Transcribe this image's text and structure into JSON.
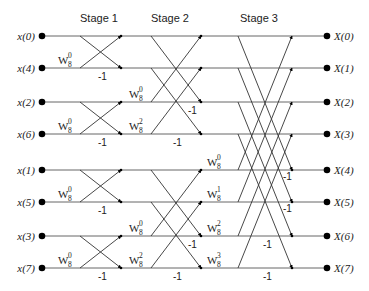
{
  "stages": [
    {
      "label": "Stage 1",
      "x": 80,
      "y": 22
    },
    {
      "label": "Stage 2",
      "x": 151,
      "y": 22
    },
    {
      "label": "Stage 3",
      "x": 240,
      "y": 22
    }
  ],
  "rows_y": [
    36,
    68,
    102,
    134,
    170,
    202,
    236,
    268
  ],
  "inputs": [
    {
      "label": "x(0)",
      "row": 0
    },
    {
      "label": "x(4)",
      "row": 1
    },
    {
      "label": "x(2)",
      "row": 2
    },
    {
      "label": "x(6)",
      "row": 3
    },
    {
      "label": "x(1)",
      "row": 4
    },
    {
      "label": "x(5)",
      "row": 5
    },
    {
      "label": "x(3)",
      "row": 6
    },
    {
      "label": "x(7)",
      "row": 7
    }
  ],
  "outputs": [
    {
      "label": "X(0)",
      "row": 0
    },
    {
      "label": "X(1)",
      "row": 1
    },
    {
      "label": "X(2)",
      "row": 2
    },
    {
      "label": "X(3)",
      "row": 3
    },
    {
      "label": "X(4)",
      "row": 4
    },
    {
      "label": "X(5)",
      "row": 5
    },
    {
      "label": "X(6)",
      "row": 6
    },
    {
      "label": "X(7)",
      "row": 7
    }
  ],
  "twiddles": [
    {
      "base": "W",
      "sub": "8",
      "sup": "0",
      "row": 1,
      "x": 58
    },
    {
      "base": "W",
      "sub": "8",
      "sup": "0",
      "row": 3,
      "x": 58
    },
    {
      "base": "W",
      "sub": "8",
      "sup": "0",
      "row": 5,
      "x": 58
    },
    {
      "base": "W",
      "sub": "8",
      "sup": "0",
      "row": 7,
      "x": 58
    },
    {
      "base": "W",
      "sub": "8",
      "sup": "0",
      "row": 2,
      "x": 129
    },
    {
      "base": "W",
      "sub": "8",
      "sup": "2",
      "row": 3,
      "x": 129
    },
    {
      "base": "W",
      "sub": "8",
      "sup": "0",
      "row": 6,
      "x": 129
    },
    {
      "base": "W",
      "sub": "8",
      "sup": "2",
      "row": 7,
      "x": 129
    },
    {
      "base": "W",
      "sub": "8",
      "sup": "0",
      "row": 4,
      "x": 207
    },
    {
      "base": "W",
      "sub": "8",
      "sup": "1",
      "row": 5,
      "x": 207
    },
    {
      "base": "W",
      "sub": "8",
      "sup": "2",
      "row": 6,
      "x": 207
    },
    {
      "base": "W",
      "sub": "8",
      "sup": "3",
      "row": 7,
      "x": 207
    }
  ],
  "neg_labels": [
    {
      "text": "-1",
      "x": 98,
      "row": 1,
      "dy": 12
    },
    {
      "text": "-1",
      "x": 98,
      "row": 3,
      "dy": 12
    },
    {
      "text": "-1",
      "x": 98,
      "row": 5,
      "dy": 12
    },
    {
      "text": "-1",
      "x": 98,
      "row": 7,
      "dy": 12
    },
    {
      "text": "-1",
      "x": 188,
      "row": 2,
      "dy": 12
    },
    {
      "text": "-1",
      "x": 173,
      "row": 3,
      "dy": 12
    },
    {
      "text": "-1",
      "x": 188,
      "row": 6,
      "dy": 12
    },
    {
      "text": "-1",
      "x": 173,
      "row": 7,
      "dy": 12
    },
    {
      "text": "-1",
      "x": 283,
      "row": 4,
      "dy": 10
    },
    {
      "text": "-1",
      "x": 283,
      "row": 5,
      "dy": 10
    },
    {
      "text": "-1",
      "x": 263,
      "row": 6,
      "dy": 12
    },
    {
      "text": "-1",
      "x": 263,
      "row": 7,
      "dy": 12
    }
  ],
  "geometry": {
    "input_dot_x": 42,
    "output_dot_x": 327,
    "stage1": {
      "x1": 80,
      "x2": 121
    },
    "stage2": {
      "x1": 151,
      "x2": 201
    },
    "stage3": {
      "x1": 238,
      "x2": 292
    }
  }
}
